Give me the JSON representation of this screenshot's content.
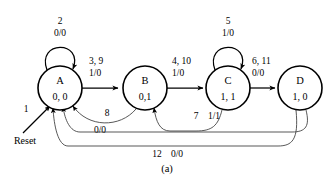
{
  "diagram": {
    "type": "finite-state-machine",
    "caption": "(a)",
    "states": [
      {
        "id": "A",
        "name": "A",
        "output": "0, 0",
        "cx": 60,
        "cy": 88,
        "r": 22
      },
      {
        "id": "B",
        "name": "B",
        "output": "0,1",
        "cx": 145,
        "cy": 88,
        "r": 22
      },
      {
        "id": "C",
        "name": "C",
        "output": "1, 1",
        "cx": 228,
        "cy": 88,
        "r": 22
      },
      {
        "id": "D",
        "name": "D",
        "output": "1, 0",
        "cx": 300,
        "cy": 88,
        "r": 22
      }
    ],
    "reset": {
      "number": "1",
      "label": "Reset",
      "target": "A"
    },
    "transitions": [
      {
        "from": "A",
        "to": "A",
        "number": "2",
        "condition": "0/0",
        "kind": "self-loop"
      },
      {
        "from": "A",
        "to": "B",
        "number": "3, 9",
        "condition": "1/0",
        "kind": "forward"
      },
      {
        "from": "B",
        "to": "C",
        "number": "4, 10",
        "condition": "1/0",
        "kind": "forward"
      },
      {
        "from": "C",
        "to": "C",
        "number": "5",
        "condition": "1/0",
        "kind": "self-loop"
      },
      {
        "from": "C",
        "to": "D",
        "number": "6, 11",
        "condition": "0/0",
        "kind": "forward"
      },
      {
        "from": "B",
        "to": "A",
        "number": "8",
        "condition": "0/0",
        "kind": "return"
      },
      {
        "from": "C",
        "to": "B",
        "number": "7",
        "condition": "1/1",
        "kind": "return"
      },
      {
        "from": "D",
        "to": "A",
        "number": "12",
        "condition": "0/0",
        "kind": "return-bottom"
      }
    ]
  },
  "labels": {
    "loop_a_num": "2",
    "loop_a_cond": "0/0",
    "ab_num": "3, 9",
    "ab_cond": "1/0",
    "bc_num": "4, 10",
    "bc_cond": "1/0",
    "loop_c_num": "5",
    "loop_c_cond": "1/0",
    "cd_num": "6, 11",
    "cd_cond": "0/0",
    "ba_num": "8",
    "ba_cond": "0/0",
    "cb_num": "7",
    "cb_cond": "1/1",
    "da_num": "12",
    "da_cond": "0/0",
    "reset_num": "1",
    "reset_text": "Reset",
    "state_a_name": "A",
    "state_a_out": "0, 0",
    "state_b_name": "B",
    "state_b_out": "0,1",
    "state_c_name": "C",
    "state_c_out": "1, 1",
    "state_d_name": "D",
    "state_d_out": "1, 0",
    "caption": "(a)"
  },
  "colors": {
    "stroke": "#000000",
    "stroke_thin": "#3a3a3a",
    "background": "#ffffff"
  }
}
